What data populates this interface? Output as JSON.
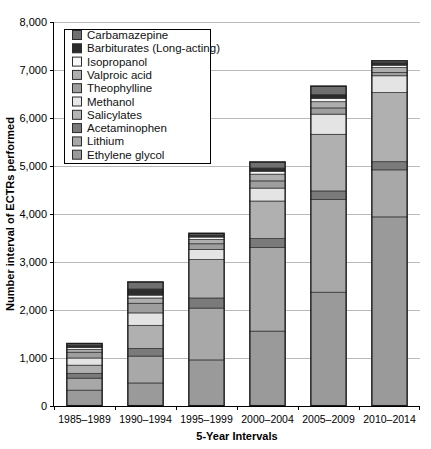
{
  "chart_data": {
    "type": "bar",
    "subtype": "stacked-vertical",
    "title": "",
    "xlabel": "5-Year Intervals",
    "ylabel": "Number interval of ECTRs performed",
    "categories": [
      "1985–1989",
      "1990–1994",
      "1995–1999",
      "2000–2004",
      "2005–2009",
      "2010–2014"
    ],
    "ylim": [
      0,
      8000
    ],
    "yticks": [
      0,
      1000,
      2000,
      3000,
      4000,
      5000,
      6000,
      7000,
      8000
    ],
    "ytick_labels": [
      "0",
      "1,000",
      "2,000",
      "3,000",
      "4,000",
      "5,000",
      "6,000",
      "7,000",
      "8,000"
    ],
    "grid": true,
    "legend_position": "upper-left-inside",
    "stack_order_bottom_to_top": [
      "Ethylene glycol",
      "Lithium",
      "Acetaminophen",
      "Salicylates",
      "Methanol",
      "Theophylline",
      "Valproic acid",
      "Isopropanol",
      "Barbiturates (Long-acting)",
      "Carbamazepine"
    ],
    "series": [
      {
        "name": "Ethylene glycol",
        "color": "#9a9a9a",
        "values": [
          330,
          480,
          960,
          1560,
          2370,
          3940
        ]
      },
      {
        "name": "Lithium",
        "color": "#a8a8a8",
        "values": [
          250,
          560,
          1080,
          1740,
          1930,
          980
        ]
      },
      {
        "name": "Acetaminophen",
        "color": "#7a7a7a",
        "values": [
          100,
          160,
          210,
          190,
          180,
          170
        ]
      },
      {
        "name": "Salicylates",
        "color": "#b0b0b0",
        "values": [
          170,
          480,
          800,
          780,
          1180,
          1440
        ]
      },
      {
        "name": "Methanol",
        "color": "#e4e4e4",
        "values": [
          150,
          260,
          210,
          270,
          420,
          350
        ]
      },
      {
        "name": "Theophylline",
        "color": "#9e9e9e",
        "values": [
          120,
          200,
          120,
          150,
          130,
          70
        ]
      },
      {
        "name": "Valproic acid",
        "color": "#aeaeae",
        "values": [
          60,
          110,
          90,
          140,
          130,
          100
        ]
      },
      {
        "name": "Isopropanol",
        "color": "#f5f5f5",
        "values": [
          40,
          60,
          50,
          60,
          70,
          50
        ]
      },
      {
        "name": "Barbiturates (Long-acting)",
        "color": "#2c2c2c",
        "values": [
          50,
          130,
          45,
          70,
          80,
          60
        ]
      },
      {
        "name": "Carbamazepine",
        "color": "#6f6f6f",
        "values": [
          40,
          150,
          40,
          130,
          180,
          40
        ]
      }
    ],
    "totals": [
      1310,
      2590,
      3605,
      5090,
      7270,
      7200
    ]
  },
  "legend": {
    "items": [
      {
        "label": "Carbamazepine",
        "color": "#6f6f6f"
      },
      {
        "label": "Barbiturates (Long-acting)",
        "color": "#2c2c2c"
      },
      {
        "label": "Isopropanol",
        "color": "#f8f8f8"
      },
      {
        "label": "Valproic acid",
        "color": "#aeaeae"
      },
      {
        "label": "Theophylline",
        "color": "#9e9e9e"
      },
      {
        "label": "Methanol",
        "color": "#e8e8e8"
      },
      {
        "label": "Salicylates",
        "color": "#b4b4b4"
      },
      {
        "label": "Acetaminophen",
        "color": "#7a7a7a"
      },
      {
        "label": "Lithium",
        "color": "#a8a8a8"
      },
      {
        "label": "Ethylene glycol",
        "color": "#9a9a9a"
      }
    ]
  }
}
